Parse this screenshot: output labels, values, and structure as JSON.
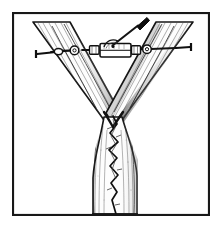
{
  "figure": {
    "title": "Tree crotch cabling repair illustration",
    "style": "black-and-white-line-drawing",
    "canvas": {
      "width": 222,
      "height": 228
    },
    "colors": {
      "background": "#ffffff",
      "ink": "#1a1a1a",
      "ink_soft": "#555555",
      "ink_light": "#8d8d8d",
      "frame": "#181818",
      "bark_fill": "#fdfdfd",
      "shadow": "#2b2b2b"
    },
    "frame": {
      "name": "illustration-border",
      "x": 12,
      "y": 12,
      "width": 198,
      "height": 204,
      "stroke_width": 2.2
    },
    "tree": {
      "name": "forked-tree",
      "fork_point": {
        "x": 113,
        "y": 118
      },
      "trunk": {
        "name": "main-trunk",
        "left_edge_x": 92,
        "right_edge_x": 138,
        "top_y": 118,
        "bottom_y": 214
      },
      "left_branch": {
        "name": "left-leader",
        "top_outer": {
          "x": 33,
          "y": 22
        },
        "top_inner": {
          "x": 70,
          "y": 22
        },
        "base": {
          "x": 113,
          "y": 118
        }
      },
      "right_branch": {
        "name": "right-leader",
        "top_outer": {
          "x": 193,
          "y": 22
        },
        "top_inner": {
          "x": 156,
          "y": 22
        },
        "base": {
          "x": 113,
          "y": 118
        }
      },
      "crack": {
        "name": "trunk-split-crack",
        "description": "jagged vertical split descending from the crotch",
        "start": {
          "x": 113,
          "y": 116
        },
        "end": {
          "x": 115,
          "y": 214
        },
        "zigzag_points": "113,116 117,124 110,133 118,142 109,150 117,158 110,166 118,175 111,183 117,192 112,200 116,214"
      }
    },
    "hardware": {
      "name": "cable-brace-assembly",
      "cable_y": 50,
      "cable": {
        "name": "steel-cable",
        "left_anchor": {
          "x": 51,
          "y": 52
        },
        "right_anchor": {
          "x": 176,
          "y": 48
        }
      },
      "left_eyebolt": {
        "name": "left-eye-bolt",
        "x": 51,
        "y": 52
      },
      "right_eyebolt": {
        "name": "right-eye-bolt",
        "x": 176,
        "y": 48
      },
      "left_thimble": {
        "name": "left-thimble-ring",
        "cx": 78,
        "cy": 50,
        "r": 4.2
      },
      "right_thimble": {
        "name": "right-thimble-ring",
        "cx": 147,
        "cy": 49,
        "r": 4.2
      },
      "turnbuckle": {
        "name": "turnbuckle-body",
        "x": 100,
        "y": 44,
        "width": 30,
        "height": 13
      },
      "turnbuckle_left_nut": {
        "name": "turnbuckle-left-nut",
        "x": 90,
        "y": 46,
        "width": 9,
        "height": 8
      },
      "turnbuckle_right_nut": {
        "name": "turnbuckle-right-nut",
        "x": 131,
        "y": 46,
        "width": 9,
        "height": 8
      },
      "tommy_bar": {
        "name": "tightening-lever-bar",
        "tip": {
          "x": 146,
          "y": 17
        },
        "base": {
          "x": 112,
          "y": 44
        },
        "grip_length": 13
      }
    }
  }
}
